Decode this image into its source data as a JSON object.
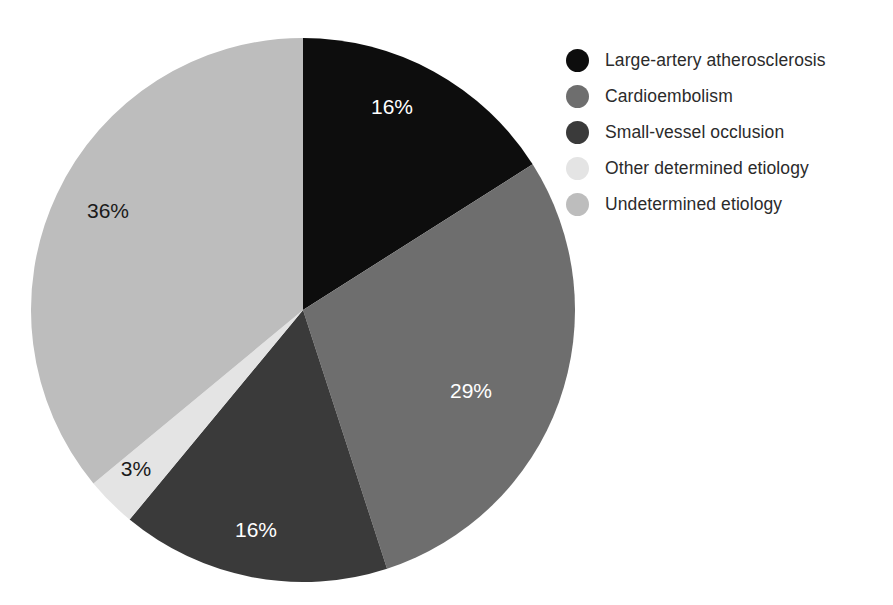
{
  "chart_data": {
    "type": "pie",
    "title": "",
    "subtitle": "",
    "xlabel": "",
    "ylabel": "",
    "grid": false,
    "legend_position": "right",
    "start_angle_deg": 90,
    "direction": "clockwise",
    "units": "percent",
    "categories": [
      "Large-artery atherosclerosis",
      "Cardioembolism",
      "Small-vessel occlusion",
      "Other determined etiology",
      "Undetermined etiology"
    ],
    "values": [
      16,
      29,
      16,
      3,
      36
    ],
    "data_labels": [
      "16%",
      "29%",
      "16%",
      "3%",
      "36%"
    ],
    "colors": [
      "#0d0d0d",
      "#6e6e6e",
      "#3a3a3a",
      "#e4e4e4",
      "#bdbdbd"
    ],
    "label_colors": [
      "#ffffff",
      "#ffffff",
      "#ffffff",
      "#1a1a1a",
      "#1a1a1a"
    ],
    "slices": [
      {
        "label": "Large-artery atherosclerosis",
        "value": 16,
        "data_label": "16%",
        "color": "#0d0d0d",
        "label_color": "#ffffff",
        "label_x": 392,
        "label_y": 108
      },
      {
        "label": "Cardioembolism",
        "value": 29,
        "data_label": "29%",
        "color": "#6e6e6e",
        "label_color": "#ffffff",
        "label_x": 471,
        "label_y": 392
      },
      {
        "label": "Small-vessel occlusion",
        "value": 16,
        "data_label": "16%",
        "color": "#3a3a3a",
        "label_color": "#ffffff",
        "label_x": 256,
        "label_y": 531
      },
      {
        "label": "Other determined etiology",
        "value": 3,
        "data_label": "3%",
        "color": "#e4e4e4",
        "label_color": "#1a1a1a",
        "label_x": 136,
        "label_y": 470
      },
      {
        "label": "Undetermined etiology",
        "value": 36,
        "data_label": "36%",
        "color": "#bdbdbd",
        "label_color": "#1a1a1a",
        "label_x": 108,
        "label_y": 212
      }
    ],
    "geometry": {
      "center_x": 303,
      "center_y": 310,
      "radius": 272
    }
  },
  "legend": {
    "items": [
      {
        "label": "Large-artery atherosclerosis",
        "color": "#0d0d0d"
      },
      {
        "label": "Cardioembolism",
        "color": "#6e6e6e"
      },
      {
        "label": "Small-vessel occlusion",
        "color": "#3a3a3a"
      },
      {
        "label": "Other determined etiology",
        "color": "#e4e4e4"
      },
      {
        "label": "Undetermined etiology",
        "color": "#bdbdbd"
      }
    ]
  }
}
